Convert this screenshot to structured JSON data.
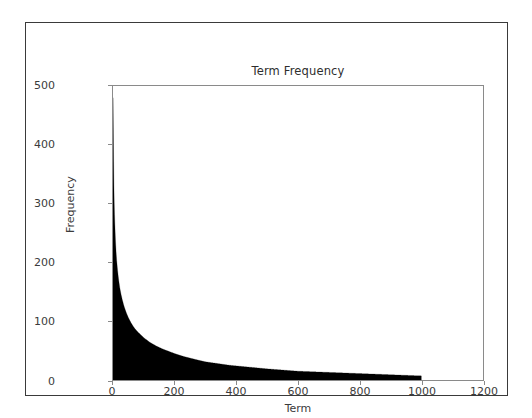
{
  "chart_data": {
    "type": "area",
    "title": "Term Frequency",
    "xlabel": "Term",
    "ylabel": "Frequency",
    "xlim": [
      0,
      1200
    ],
    "ylim": [
      0,
      500
    ],
    "grid": false,
    "legend": null,
    "fill_color": "#000000",
    "line_color": "#000000",
    "spine_color": "#8a8a8a",
    "text_color": "#3b3b3b",
    "background_color": "#ffffff",
    "xticks": [
      0,
      200,
      400,
      600,
      800,
      1000,
      1200
    ],
    "xtick_labels": [
      "0",
      "200",
      "400",
      "600",
      "800",
      "1000",
      "1200"
    ],
    "yticks": [
      0,
      100,
      200,
      300,
      400,
      500
    ],
    "ytick_labels": [
      "0",
      "100",
      "200",
      "300",
      "400",
      "500"
    ],
    "data_x_range": [
      0,
      1000
    ],
    "x": [
      0,
      1,
      2,
      3,
      4,
      5,
      6,
      8,
      10,
      12,
      15,
      18,
      22,
      26,
      30,
      35,
      40,
      45,
      50,
      60,
      70,
      80,
      90,
      100,
      120,
      140,
      160,
      180,
      200,
      230,
      260,
      300,
      340,
      380,
      420,
      460,
      500,
      550,
      600,
      650,
      700,
      750,
      800,
      850,
      900,
      950,
      1000
    ],
    "y": [
      480,
      430,
      372,
      330,
      302,
      281,
      265,
      238,
      218,
      203,
      186,
      172,
      157,
      146,
      137,
      127,
      119,
      112,
      106,
      96,
      88,
      82,
      77,
      72,
      64,
      58,
      53,
      49,
      45,
      40,
      36,
      31,
      28,
      25,
      23,
      21,
      19,
      17,
      15,
      14,
      13,
      12,
      11,
      10,
      9,
      8,
      7
    ]
  }
}
